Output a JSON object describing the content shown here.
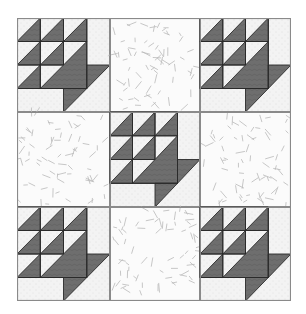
{
  "quilt": {
    "title": "Basket quilt pattern",
    "grid": {
      "rows": 3,
      "cols": 3
    },
    "layout": [
      [
        "basket",
        "plain",
        "basket"
      ],
      [
        "plain",
        "basket",
        "plain"
      ],
      [
        "basket",
        "plain",
        "basket"
      ]
    ],
    "colors": {
      "dark": "#6e6e6e",
      "light": "#f3f3f3",
      "plain_bg": "#fbfbfb",
      "confetti": "#b9b9b9",
      "seam": "#8a8a8a",
      "outline": "#2a2a2a"
    }
  }
}
